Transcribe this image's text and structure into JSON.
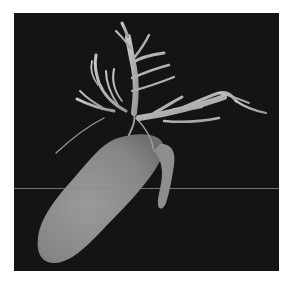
{
  "image": {
    "alt": "3D rendering of gallbladder with biliary tree on black background",
    "subjects": [
      "gallbladder",
      "cystic-duct",
      "biliary-tree"
    ],
    "colors": {
      "background": "#ffffff",
      "panel": "#141414",
      "organ": "#8c8c8c",
      "ducts": "#b4b4b4",
      "scanline": "#8a8a8a"
    },
    "scanline_y": 175
  }
}
